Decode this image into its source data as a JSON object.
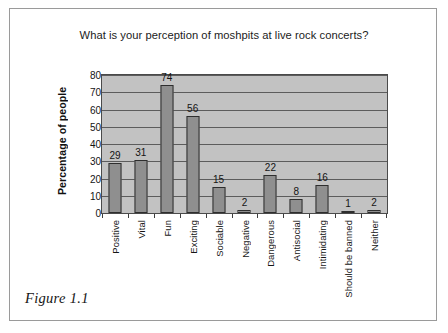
{
  "figure": {
    "caption": "Figure 1.1"
  },
  "chart_data": {
    "type": "bar",
    "title": "What is your perception of moshpits at live rock concerts?",
    "xlabel": "",
    "ylabel": "Percentage of people",
    "categories": [
      "Positive",
      "Vital",
      "Fun",
      "Exciting",
      "Sociable",
      "Negative",
      "Dangerous",
      "Antisocial",
      "Intimidating",
      "Should be banned",
      "Neither"
    ],
    "values": [
      29,
      31,
      74,
      56,
      15,
      2,
      22,
      8,
      16,
      1,
      2
    ],
    "ylim": [
      0,
      80
    ],
    "ytick_step": 10,
    "yticks": [
      0,
      10,
      20,
      30,
      40,
      50,
      60,
      70,
      80
    ],
    "ytick_labels": [
      "0",
      "10",
      "20",
      "30",
      "40",
      "50",
      "60",
      "70",
      "80"
    ],
    "value_labels": [
      "29",
      "31",
      "74",
      "56",
      "15",
      "2",
      "22",
      "8",
      "16",
      "1",
      "2"
    ],
    "grid": true,
    "legend": false,
    "colors": {
      "bar_fill": "#8f8f8f",
      "bar_outline": "#2e2e2e",
      "plot_background": "#c2c2c2",
      "gridline": "#5c5c5c",
      "text": "#141414",
      "page_border": "#9a9a9a"
    }
  }
}
